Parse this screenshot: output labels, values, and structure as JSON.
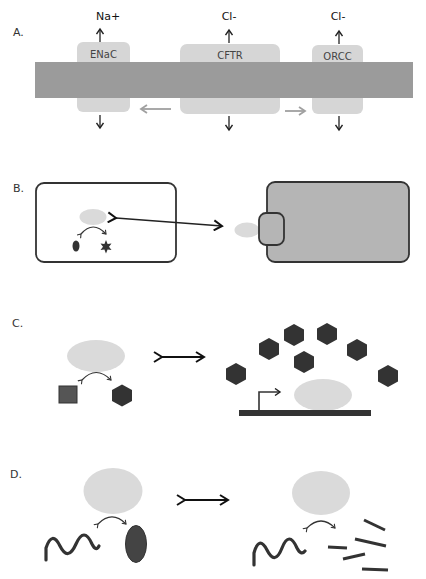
{
  "panels": {
    "A": {
      "label": "A.",
      "channels": [
        {
          "name": "ENaC",
          "ion": "Na+"
        },
        {
          "name": "CFTR",
          "ion": "Cl-"
        },
        {
          "name": "ORCC",
          "ion": "Cl-"
        }
      ]
    },
    "B": {
      "label": "B."
    },
    "C": {
      "label": "C."
    },
    "D": {
      "label": "D."
    }
  },
  "colors": {
    "membrane": "#9b9b9b",
    "channel": "#d6d6d6",
    "light_protein": "#dadada",
    "dark_shape": "#3a3a3a",
    "cell_fill": "#b5b5b5",
    "outline": "#333333",
    "gray_arrow": "#a0a0a0"
  }
}
